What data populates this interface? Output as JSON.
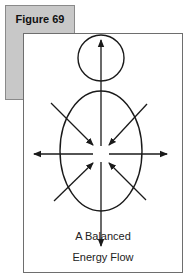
{
  "figure": {
    "label": "Figure 69",
    "caption_line1": "A Balanced",
    "caption_line2": "Energy Flow"
  },
  "diagram": {
    "shapes": [
      "head-circle",
      "body-ellipse"
    ],
    "arrows": {
      "outward": [
        "up",
        "down",
        "left",
        "right"
      ],
      "inward": [
        "upper-left",
        "upper-right",
        "lower-left",
        "lower-right"
      ]
    },
    "colors": {
      "tab_background": "#c8c8c8",
      "stroke": "#1a1a1a"
    }
  }
}
